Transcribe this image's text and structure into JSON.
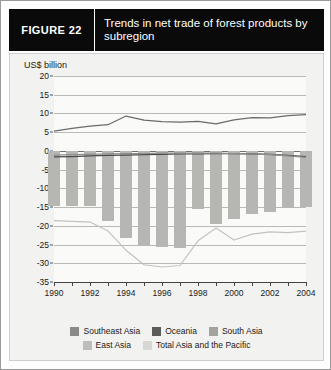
{
  "figure": {
    "label": "FIGURE  22",
    "title": "Trends in net trade of forest products by subregion"
  },
  "chart_data": {
    "type": "line",
    "title": "Trends in net trade of forest products by subregion",
    "xlabel": "",
    "ylabel": "US$ billion",
    "unit_label": "US$ billion",
    "grid": true,
    "legend_position": "bottom",
    "x": [
      1990,
      1991,
      1992,
      1993,
      1994,
      1995,
      1996,
      1997,
      1998,
      1999,
      2000,
      2001,
      2002,
      2003,
      2004
    ],
    "xtick_labels": [
      "1990",
      "",
      "1992",
      "",
      "1994",
      "",
      "1996",
      "",
      "1998",
      "",
      "2000",
      "",
      "2002",
      "",
      "2004"
    ],
    "xlim": [
      1990,
      2004
    ],
    "ylim": [
      -35,
      20
    ],
    "yticks": [
      20,
      15,
      10,
      5,
      0,
      -5,
      -10,
      -15,
      -20,
      -25,
      -30,
      -35
    ],
    "ytick_labels": [
      "20",
      "15",
      "10",
      "5",
      "0",
      "-5",
      "-10",
      "-15",
      "-20",
      "-25",
      "-30",
      "-35"
    ],
    "series": [
      {
        "name": "Southeast Asia",
        "render": "line",
        "color": "#6b6b6b",
        "values": [
          5.3,
          6.0,
          6.6,
          7.0,
          9.3,
          8.2,
          7.8,
          7.7,
          7.9,
          7.2,
          8.3,
          8.9,
          8.8,
          9.4,
          9.7
        ]
      },
      {
        "name": "Oceania",
        "render": "line",
        "color": "#4a4a4a",
        "values": [
          -1.6,
          -1.5,
          -1.3,
          -1.2,
          -1.1,
          -1.0,
          -0.9,
          -0.8,
          -0.8,
          -0.7,
          -0.7,
          -0.8,
          -0.9,
          -1.2,
          -1.5
        ]
      },
      {
        "name": "South Asia",
        "render": "line",
        "color": "#8d8d8d",
        "values": [
          -1.1,
          -1.0,
          -0.9,
          -0.8,
          -0.7,
          -0.7,
          -0.6,
          -0.6,
          -0.6,
          -0.6,
          -0.7,
          -0.8,
          -1.0,
          -1.3,
          -1.7
        ]
      },
      {
        "name": "East Asia",
        "render": "bar",
        "color": "#b6b6b2",
        "values": [
          -14.8,
          -14.8,
          -14.8,
          -18.6,
          -23.2,
          -25.4,
          -25.6,
          -25.8,
          -15.4,
          -19.6,
          -18.3,
          -16.8,
          -16.4,
          -15.2,
          -15.0
        ]
      },
      {
        "name": "Total Asia and the Pacific",
        "render": "line",
        "color": "#c2c2be",
        "values": [
          -18.6,
          -18.8,
          -19.0,
          -21.4,
          -26.5,
          -30.4,
          -31.0,
          -30.6,
          -24.0,
          -20.6,
          -23.8,
          -22.2,
          -21.6,
          -21.8,
          -21.4
        ]
      }
    ],
    "legend": [
      {
        "name": "Southeast Asia",
        "color": "#8a8a86"
      },
      {
        "name": "Oceania",
        "color": "#5c5c59"
      },
      {
        "name": "South Asia",
        "color": "#a3a39f"
      },
      {
        "name": "East Asia",
        "color": "#bdbdb9"
      },
      {
        "name": "Total Asia and the Pacific",
        "color": "#d7d7d3"
      }
    ]
  }
}
